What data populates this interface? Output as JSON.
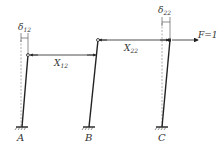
{
  "diagram": {
    "columns": [
      {
        "id": "A",
        "label": "A"
      },
      {
        "id": "B",
        "label": "B"
      },
      {
        "id": "C",
        "label": "C"
      }
    ],
    "links": [
      {
        "label_main": "X",
        "label_sub": "12"
      },
      {
        "label_main": "X",
        "label_sub": "22"
      }
    ],
    "displacements": [
      {
        "label_main": "δ",
        "label_sub": "12"
      },
      {
        "label_main": "δ",
        "label_sub": "22"
      }
    ],
    "force": {
      "label": "F=1"
    },
    "colors": {
      "line": "#222222",
      "dashed": "#888888",
      "text": "#333333"
    }
  }
}
